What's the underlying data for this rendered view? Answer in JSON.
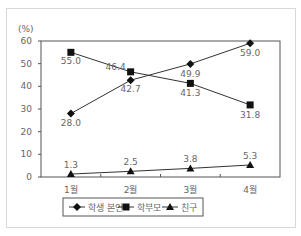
{
  "chart_data": {
    "type": "line",
    "title": "",
    "ylabel": "(%)",
    "xlabel": "",
    "categories": [
      "1월",
      "2월",
      "3월",
      "4월"
    ],
    "ylim": [
      0,
      60
    ],
    "yticks": [
      0,
      10,
      20,
      30,
      40,
      50,
      60
    ],
    "grid": false,
    "legend_position": "bottom",
    "series": [
      {
        "name": "학생 본인",
        "marker": "diamond",
        "values": [
          28.0,
          42.7,
          49.9,
          59.0
        ],
        "labels": [
          "28.0",
          "42.7",
          "49.9",
          "59.0"
        ]
      },
      {
        "name": "학부모",
        "marker": "square",
        "values": [
          55.0,
          46.4,
          41.3,
          31.8
        ],
        "labels": [
          "55.0",
          "46.4",
          "41.3",
          "31.8"
        ]
      },
      {
        "name": "친구",
        "marker": "triangle",
        "values": [
          1.3,
          2.5,
          3.8,
          5.3
        ],
        "labels": [
          "1.3",
          "2.5",
          "3.8",
          "5.3"
        ]
      }
    ]
  },
  "colors": {
    "line": "#333333",
    "text": "#666666",
    "frame": "#555555"
  }
}
